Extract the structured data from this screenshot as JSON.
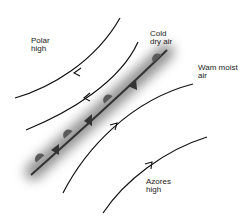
{
  "diagram": {
    "type": "weather-front-map",
    "labels": {
      "polar_high": [
        "Polar",
        "high"
      ],
      "cold_dry_air": [
        "Cold",
        "dry air"
      ],
      "warm_moist_air": [
        "Wam moist",
        "air"
      ],
      "azores_high": [
        "Azores",
        "high"
      ]
    },
    "streamlines": [
      {
        "name": "polar-streamline-outer",
        "direction": "southwest"
      },
      {
        "name": "polar-streamline-inner",
        "direction": "southwest"
      },
      {
        "name": "tropical-streamline-inner",
        "direction": "northeast"
      },
      {
        "name": "tropical-streamline-outer",
        "direction": "northeast"
      }
    ],
    "front": {
      "name": "weather-front",
      "symbols": [
        "semicircle",
        "triangle"
      ],
      "colors": {
        "line": "#333333",
        "symbol": "#555555",
        "shadow": "#888888"
      }
    }
  }
}
